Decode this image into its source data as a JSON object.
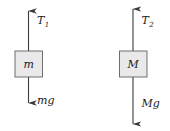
{
  "figure": {
    "background_color": "#ffffff",
    "line_color": "#3a3a3a",
    "box_fill_color": "#e9e9e9",
    "box_border_color": "#6e6e6e",
    "text_color": "#1a1a1a"
  },
  "bodies": [
    {
      "id": "body-left",
      "mass_label": "m",
      "tension_label": "T",
      "tension_subscript": "1",
      "weight_label": "mg",
      "tension_direction": "up",
      "weight_direction": "down"
    },
    {
      "id": "body-right",
      "mass_label": "M",
      "tension_label": "T",
      "tension_subscript": "2",
      "weight_label": "Mg",
      "tension_direction": "up",
      "weight_direction": "down"
    }
  ]
}
